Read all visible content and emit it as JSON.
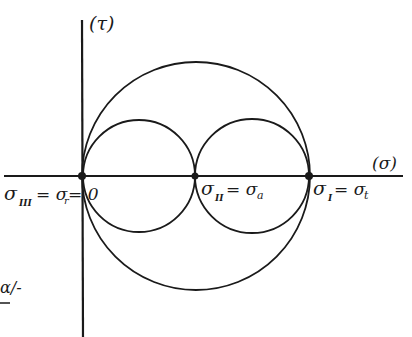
{
  "diagram": {
    "axes": {
      "y_label": "(τ)",
      "x_label": "(σ)"
    },
    "points": [
      {
        "id": "sigma3",
        "label_main": "σ",
        "label_sub": "III",
        "label_rest": "= σ",
        "label_sub2": "r",
        "label_tail": "= 0"
      },
      {
        "id": "sigma2",
        "label_main": "σ",
        "label_sub": "II",
        "label_rest": "= σ",
        "label_sub2": "a"
      },
      {
        "id": "sigma1",
        "label_main": "σ",
        "label_sub": "I",
        "label_rest": "= σ",
        "label_sub2": "t"
      }
    ],
    "fragment_text": "ɑ/-",
    "circles": [
      "outer-circle σIII–σI",
      "left-circle σIII–σII",
      "right-circle σII–σI"
    ],
    "colors": {
      "ink": "#1a1a1a",
      "background": "#ffffff"
    }
  }
}
